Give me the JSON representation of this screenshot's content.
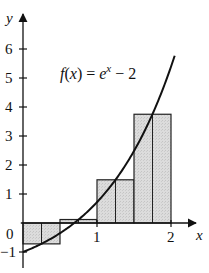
{
  "chart_data": {
    "type": "bar",
    "subtype": "midpoint-riemann-sum-with-curve",
    "title": "",
    "function_label": "f(x) = e^x − 2",
    "function_label_parts": {
      "lhs": "f(x) = e",
      "exp": "x",
      "rhs": " − 2"
    },
    "xlabel": "x",
    "ylabel": "y",
    "x_ticks": [
      0,
      1,
      2
    ],
    "y_ticks": [
      -1,
      1,
      2,
      3,
      4,
      5,
      6
    ],
    "x_tick_labels": [
      "0",
      "1",
      "2"
    ],
    "y_tick_labels": [
      "−1",
      "1",
      "2",
      "3",
      "4",
      "5",
      "6"
    ],
    "xlim": [
      -0.3,
      2.45
    ],
    "ylim": [
      -1.7,
      7.1
    ],
    "grid": false,
    "legend": "none",
    "intervals": [
      [
        0,
        0.5
      ],
      [
        0.5,
        1.0
      ],
      [
        1.0,
        1.5
      ],
      [
        1.5,
        2.0
      ]
    ],
    "midpoints": [
      0.25,
      0.75,
      1.25,
      1.75
    ],
    "values": [
      -0.72,
      0.12,
      1.49,
      3.75
    ],
    "curve": {
      "expr": "exp(x) - 2",
      "x_range": [
        0,
        2.05
      ]
    },
    "colors": {
      "bar_fill": "#d9d9d9",
      "bar_stroke": "#222222",
      "curve": "#111111",
      "axis": "#111111"
    }
  }
}
